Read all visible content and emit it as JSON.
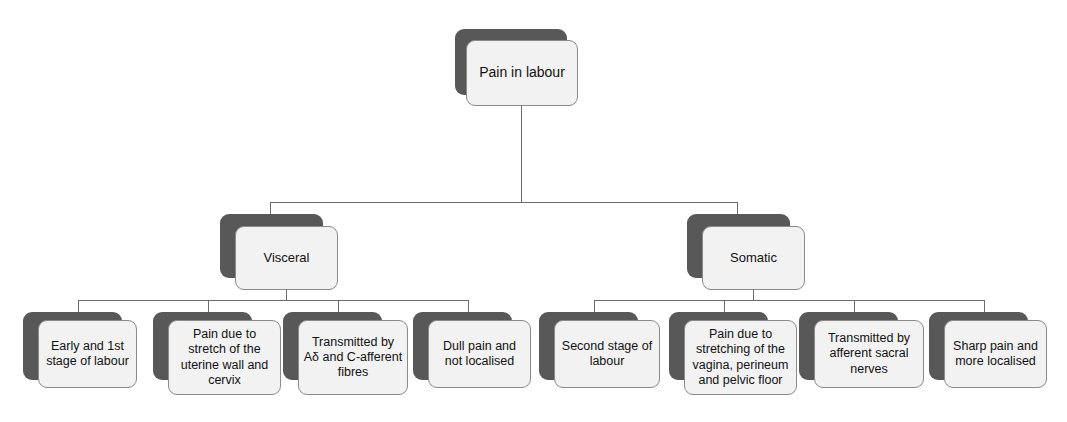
{
  "diagram": {
    "type": "tree",
    "title": "Pain in labour",
    "root": {
      "label": "Pain in labour"
    },
    "branches": [
      {
        "label": "Visceral",
        "children": [
          {
            "label": "Early and 1st stage of labour"
          },
          {
            "label": "Pain due to stretch of the uterine wall and cervix"
          },
          {
            "label": "Transmitted by Aδ and C-afferent fibres"
          },
          {
            "label": "Dull pain and not localised"
          }
        ]
      },
      {
        "label": "Somatic",
        "children": [
          {
            "label": "Second stage of labour"
          },
          {
            "label": "Pain due to stretching of the vagina, perineum and pelvic floor"
          },
          {
            "label": "Transmitted by afferent sacral nerves"
          },
          {
            "label": "Sharp pain and more localised"
          }
        ]
      }
    ],
    "colors": {
      "card_fill": "#f2f2f2",
      "card_border": "#8a8a8a",
      "card_shadow": "#585858",
      "connector": "#6b6b6b",
      "text": "#111111",
      "background": "#ffffff"
    }
  }
}
